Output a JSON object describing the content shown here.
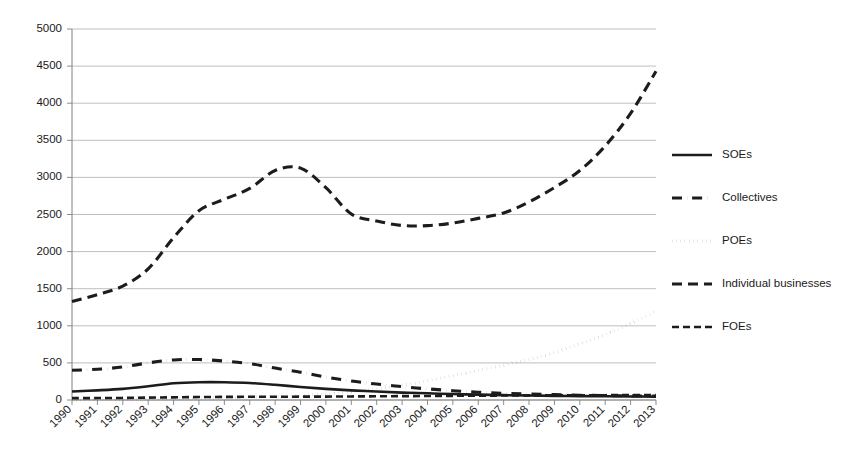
{
  "chart_data": {
    "type": "line",
    "title": "",
    "subtitle": "",
    "xlabel": "",
    "ylabel": "",
    "grid": true,
    "legend_position": "right",
    "ylim": [
      0,
      5000
    ],
    "ytick_labels": [
      "5000",
      "4500",
      "4000",
      "3500",
      "3000",
      "2500",
      "2000",
      "1500",
      "1000",
      "500",
      "0"
    ],
    "ytick_values": [
      5000,
      4500,
      4000,
      3500,
      3000,
      2500,
      2000,
      1500,
      1000,
      500,
      0
    ],
    "categories": [
      "1990",
      "1991",
      "1992",
      "1993",
      "1994",
      "1995",
      "1996",
      "1997",
      "1998",
      "1999",
      "2000",
      "2001",
      "2002",
      "2003",
      "2004",
      "2005",
      "2006",
      "2007",
      "2008",
      "2009",
      "2010",
      "2011",
      "2012",
      "2013"
    ],
    "series": [
      {
        "name": "SOEs",
        "dash_style": "solid",
        "values": [
          115,
          130,
          150,
          185,
          225,
          240,
          240,
          230,
          205,
          175,
          150,
          130,
          115,
          100,
          90,
          80,
          72,
          66,
          60,
          56,
          52,
          50,
          48,
          46
        ]
      },
      {
        "name": "Collectives",
        "dash_style": "dash-dot",
        "values": [
          400,
          415,
          445,
          500,
          540,
          545,
          525,
          490,
          430,
          375,
          310,
          255,
          215,
          180,
          150,
          125,
          105,
          90,
          80,
          72,
          65,
          60,
          55,
          52
        ]
      },
      {
        "name": "POEs",
        "dash_style": "dotted",
        "values": [
          2,
          3,
          5,
          10,
          18,
          25,
          32,
          40,
          50,
          62,
          80,
          110,
          150,
          200,
          260,
          330,
          400,
          470,
          545,
          640,
          755,
          880,
          1030,
          1200
        ]
      },
      {
        "name": "Individual businesses",
        "dash_style": "long-dash",
        "values": [
          1328,
          1420,
          1534,
          1767,
          2187,
          2550,
          2705,
          2851,
          3093,
          3125,
          2861,
          2506,
          2412,
          2352,
          2350,
          2385,
          2448,
          2520,
          2668,
          2863,
          3092,
          3424,
          3863,
          4430
        ]
      },
      {
        "name": "FOEs",
        "dash_style": "dash",
        "values": [
          25,
          26,
          28,
          32,
          36,
          40,
          42,
          43,
          44,
          45,
          46,
          48,
          50,
          52,
          54,
          56,
          58,
          60,
          62,
          63,
          64,
          65,
          66,
          67
        ]
      }
    ]
  },
  "legend": {
    "items": [
      {
        "label": "SOEs",
        "dash_style": "solid"
      },
      {
        "label": "Collectives",
        "dash_style": "dash-dot"
      },
      {
        "label": "POEs",
        "dash_style": "dotted"
      },
      {
        "label": "Individual businesses",
        "dash_style": "long-dash"
      },
      {
        "label": "FOEs",
        "dash_style": "dash"
      }
    ]
  }
}
